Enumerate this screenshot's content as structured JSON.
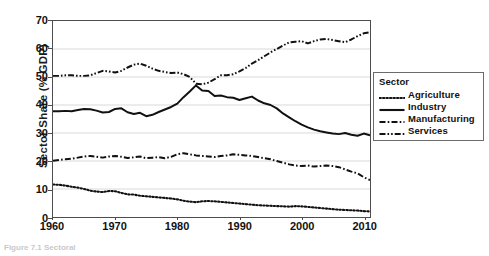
{
  "axes": {
    "y_title": "Sector Share (% GDP)",
    "y_ticks": [
      "0",
      "10",
      "20",
      "30",
      "40",
      "50",
      "60",
      "70"
    ],
    "x_ticks": [
      "1960",
      "1970",
      "1980",
      "1990",
      "2000",
      "2010"
    ]
  },
  "legend": {
    "title": "Sector",
    "entries": [
      {
        "label": "Agriculture",
        "style": "dotted",
        "color": "#111111"
      },
      {
        "label": "Industry",
        "style": "solid",
        "color": "#111111"
      },
      {
        "label": "Manufacturing",
        "style": "dash-dot",
        "color": "#111111"
      },
      {
        "label": "Services",
        "style": "dash-dot-dot",
        "color": "#111111"
      }
    ]
  },
  "caption": "Figure 7.1  Sectoral",
  "chart_data": {
    "type": "line",
    "title": "",
    "xlabel": "",
    "ylabel": "Sector Share (% GDP)",
    "xlim": [
      1960,
      2011
    ],
    "ylim": [
      0,
      70
    ],
    "grid": "horizontal",
    "legend_position": "right-outside",
    "legend_title": "Sector",
    "x": [
      1960,
      1961,
      1962,
      1963,
      1964,
      1965,
      1966,
      1967,
      1968,
      1969,
      1970,
      1971,
      1972,
      1973,
      1974,
      1975,
      1976,
      1977,
      1978,
      1979,
      1980,
      1981,
      1982,
      1983,
      1984,
      1985,
      1986,
      1987,
      1988,
      1989,
      1990,
      1991,
      1992,
      1993,
      1994,
      1995,
      1996,
      1997,
      1998,
      1999,
      2000,
      2001,
      2002,
      2003,
      2004,
      2005,
      2006,
      2007,
      2008,
      2009,
      2010,
      2011
    ],
    "series": [
      {
        "name": "Agriculture",
        "style": "dotted",
        "values": [
          11.6,
          11.5,
          11.2,
          10.8,
          10.5,
          10.0,
          9.4,
          9.1,
          8.9,
          9.3,
          9.2,
          8.6,
          8.1,
          8.0,
          7.6,
          7.4,
          7.2,
          7.0,
          6.8,
          6.6,
          6.3,
          5.8,
          5.5,
          5.3,
          5.6,
          5.7,
          5.6,
          5.4,
          5.2,
          5.0,
          4.8,
          4.6,
          4.4,
          4.2,
          4.1,
          4.0,
          3.9,
          3.8,
          3.7,
          3.9,
          3.8,
          3.6,
          3.4,
          3.2,
          3.0,
          2.8,
          2.6,
          2.5,
          2.4,
          2.3,
          2.1,
          2.0
        ]
      },
      {
        "name": "Industry",
        "style": "solid",
        "values": [
          37.8,
          37.8,
          37.9,
          37.8,
          38.2,
          38.6,
          38.5,
          38.0,
          37.3,
          37.5,
          38.6,
          38.8,
          37.4,
          36.8,
          37.2,
          36.0,
          36.5,
          37.5,
          38.4,
          39.3,
          40.5,
          42.8,
          44.8,
          47.0,
          45.2,
          45.0,
          43.2,
          43.4,
          42.8,
          42.6,
          41.8,
          42.4,
          43.0,
          41.6,
          40.6,
          40.0,
          38.8,
          37.0,
          35.6,
          34.2,
          33.0,
          32.0,
          31.2,
          30.6,
          30.2,
          29.8,
          29.6,
          30.0,
          29.4,
          29.0,
          29.8,
          29.2
        ]
      },
      {
        "name": "Manufacturing",
        "style": "dash-dot",
        "values": [
          20.1,
          20.4,
          20.6,
          20.8,
          21.2,
          21.6,
          21.8,
          21.5,
          21.2,
          21.6,
          21.8,
          21.5,
          21.1,
          21.3,
          21.6,
          21.0,
          21.2,
          21.4,
          21.0,
          21.5,
          22.4,
          22.8,
          22.4,
          22.0,
          21.8,
          21.6,
          21.4,
          21.8,
          22.0,
          22.4,
          22.2,
          22.0,
          21.8,
          21.4,
          21.0,
          20.6,
          20.0,
          19.4,
          18.8,
          18.4,
          18.2,
          18.4,
          18.0,
          18.2,
          18.4,
          18.2,
          17.8,
          17.0,
          16.2,
          15.6,
          14.2,
          13.2
        ]
      },
      {
        "name": "Services",
        "style": "dash-dot-dot",
        "values": [
          50.4,
          50.4,
          50.6,
          50.6,
          50.4,
          50.4,
          50.6,
          51.4,
          52.2,
          52.0,
          51.6,
          52.2,
          53.4,
          54.4,
          54.8,
          54.0,
          53.0,
          52.2,
          51.8,
          51.4,
          51.6,
          51.0,
          50.0,
          47.6,
          47.4,
          48.0,
          49.2,
          50.6,
          50.6,
          51.0,
          52.0,
          53.2,
          54.8,
          56.0,
          57.4,
          58.8,
          60.0,
          61.2,
          62.4,
          62.6,
          62.8,
          62.0,
          62.8,
          63.4,
          63.6,
          63.2,
          62.8,
          62.4,
          63.4,
          64.6,
          65.6,
          66.0
        ]
      }
    ]
  }
}
